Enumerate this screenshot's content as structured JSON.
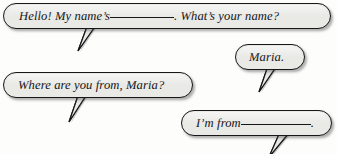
{
  "worksheet": {
    "type": "dialogue-speech-bubbles",
    "style": {
      "bubble_fill": "#e9e9e6",
      "bubble_border": "#17171a",
      "text_color": "#111114",
      "background": "#fdfdfc"
    }
  },
  "bubbles": [
    {
      "id": "bubble-1",
      "speaker_role": "asker",
      "text_before_blank": "Hello! My name’s",
      "blank": "__________",
      "text_after_blank": ". What’s your name?",
      "full_text": "Hello! My name’s __________ . What’s your name?",
      "tail_direction": "down-left"
    },
    {
      "id": "bubble-2",
      "speaker_role": "asker",
      "full_text": "Where are you from, Maria?",
      "tail_direction": "down-left"
    },
    {
      "id": "bubble-3",
      "speaker_role": "responder",
      "full_text": "Maria.",
      "tail_direction": "down-left"
    },
    {
      "id": "bubble-4",
      "speaker_role": "responder",
      "text_before_blank": "I’m from",
      "blank": "__________",
      "text_after_blank": ".",
      "full_text": "I’m from __________ .",
      "tail_direction": "down-left"
    }
  ]
}
